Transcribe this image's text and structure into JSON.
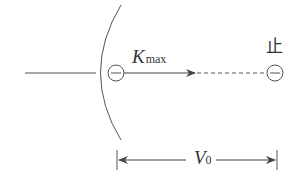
{
  "diagram": {
    "type": "photoelectric-stopping-diagram",
    "labels": {
      "kinetic_energy": "K",
      "kinetic_energy_sub": "max",
      "stop_char": "止",
      "voltage": "V",
      "voltage_sub": "0"
    },
    "elements": {
      "emitter_surface": "curved electrode (arc)",
      "electron_start_symbol": "⊖",
      "electron_end_symbol": "⊖"
    },
    "colors": {
      "stroke": "#444444",
      "text": "#333333",
      "background": "#ffffff"
    }
  }
}
